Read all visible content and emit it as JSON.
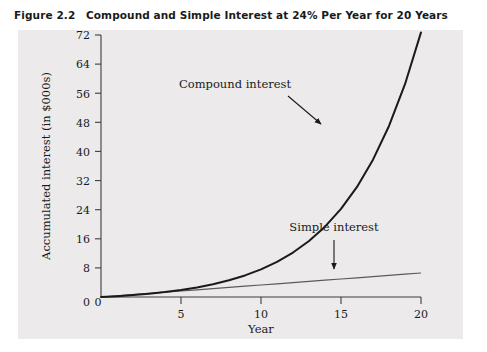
{
  "figure": {
    "number": "Figure 2.2",
    "title": "Compound and Simple Interest at 24% Per Year for 20 Years"
  },
  "colors": {
    "panel_background": "#eceaea",
    "page_background": "#ffffff",
    "axis": "#3d3d3d",
    "compound_line": "#1a1a1a",
    "simple_line": "#5a5a5a",
    "text": "#1a1a1a"
  },
  "chart_data": {
    "type": "line",
    "title": "Compound and Simple Interest at 24% Per Year for 20 Years",
    "xlabel": "Year",
    "ylabel": "Accumulated interest (in $000s)",
    "xlim": [
      0,
      20
    ],
    "ylim": [
      0,
      72
    ],
    "xticks": [
      "0",
      "5",
      "10",
      "15",
      "20"
    ],
    "yticks": [
      "0",
      "8",
      "16",
      "24",
      "32",
      "40",
      "48",
      "56",
      "64",
      "72"
    ],
    "grid": false,
    "legend_position": "inline-annotations",
    "x": [
      0,
      1,
      2,
      3,
      4,
      5,
      6,
      7,
      8,
      9,
      10,
      11,
      12,
      13,
      14,
      15,
      16,
      17,
      18,
      19,
      20
    ],
    "series": [
      {
        "name": "Compound interest",
        "values": [
          0,
          0.24,
          0.538,
          0.907,
          1.364,
          1.932,
          2.635,
          3.508,
          4.59,
          5.931,
          7.594,
          9.657,
          12.215,
          15.386,
          19.319,
          24.196,
          30.243,
          37.742,
          47.0,
          58.474,
          72.71
        ]
      },
      {
        "name": "Simple interest",
        "values": [
          0,
          0.33,
          0.66,
          0.99,
          1.32,
          1.65,
          1.98,
          2.31,
          2.64,
          2.97,
          3.3,
          3.63,
          3.96,
          4.29,
          4.62,
          4.95,
          5.28,
          5.61,
          5.94,
          6.27,
          6.6
        ]
      }
    ],
    "annotations": [
      {
        "text": "Compound interest",
        "x_label": 9.5,
        "y_label": 58,
        "arrow_to_x": 17.3,
        "arrow_to_y": 42
      },
      {
        "text": "Simple interest",
        "x_label": 14.5,
        "y_label": 18,
        "arrow_to_x": 17.2,
        "arrow_to_y": 7.3
      }
    ]
  }
}
